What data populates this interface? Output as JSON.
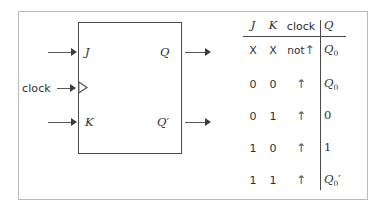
{
  "figure": {
    "diagram": {
      "title": "JK flip-flop block diagram",
      "inputs": {
        "j_label": "J",
        "k_label": "K",
        "clock_label": "clock"
      },
      "outputs": {
        "q_label": "Q",
        "qprime_label": "Q′"
      }
    },
    "truth_table": {
      "headers": {
        "j": "J",
        "k": "K",
        "clock": "clock",
        "q": "Q"
      },
      "rows": [
        {
          "j": "X",
          "k": "X",
          "clock_text": "not",
          "clock_arrow": "↑",
          "q_base": "Q",
          "q_sub": "0",
          "q_prime": ""
        },
        {
          "j": "0",
          "k": "0",
          "clock_text": "",
          "clock_arrow": "↑",
          "q_base": "Q",
          "q_sub": "0",
          "q_prime": ""
        },
        {
          "j": "0",
          "k": "1",
          "clock_text": "",
          "clock_arrow": "↑",
          "q_base": "0",
          "q_sub": "",
          "q_prime": ""
        },
        {
          "j": "1",
          "k": "0",
          "clock_text": "",
          "clock_arrow": "↑",
          "q_base": "1",
          "q_sub": "",
          "q_prime": ""
        },
        {
          "j": "1",
          "k": "1",
          "clock_text": "",
          "clock_arrow": "↑",
          "q_base": "Q",
          "q_sub": "0",
          "q_prime": "′"
        }
      ]
    },
    "colors": {
      "frame": "#b9b9b9",
      "box": "#4b4b4b",
      "wire": "#5a5a5a",
      "text": "#2e2e2e",
      "rule": "#4a4a4a"
    }
  }
}
